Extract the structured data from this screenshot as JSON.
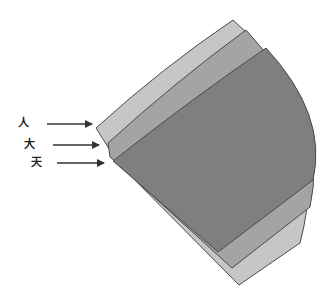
{
  "diagram": {
    "labels": [
      {
        "text": "人",
        "x": 18,
        "y": 118
      },
      {
        "text": "大",
        "x": 24,
        "y": 139
      },
      {
        "text": "天",
        "x": 31,
        "y": 157
      }
    ],
    "layers": [
      {
        "name": "outer-layer",
        "color": "#c6c6c6"
      },
      {
        "name": "middle-layer",
        "color": "#a4a4a4"
      },
      {
        "name": "inner-layer",
        "color": "#7f7f7f"
      }
    ],
    "edge_color": "#4a4a4a",
    "arrow_color": "#333333"
  }
}
